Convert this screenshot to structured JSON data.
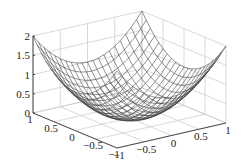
{
  "chart_data": {
    "type": "surface3d",
    "function": "z = x^2 + y^2",
    "title": "",
    "xlabel": "",
    "ylabel": "",
    "zlabel": "",
    "x_ticks": [
      -1,
      -0.5,
      0,
      0.5,
      1
    ],
    "y_ticks": [
      -1,
      -0.5,
      0,
      0.5,
      1
    ],
    "z_ticks": [
      0,
      0.5,
      1,
      1.5,
      2
    ],
    "x_tick_labels": [
      "−1",
      "−0.5",
      "0",
      "0.5",
      "1"
    ],
    "y_tick_labels": [
      "−1",
      "−0.5",
      "0",
      "0.5",
      "1"
    ],
    "z_tick_labels": [
      "0",
      "0.5",
      "1",
      "1.5",
      "2"
    ],
    "xlim": [
      -1,
      1
    ],
    "ylim": [
      -1,
      1
    ],
    "zlim": [
      0,
      2
    ],
    "grid": true,
    "mesh_resolution": 21,
    "colors": {
      "mesh": "#3a3a3a",
      "grid": "#c8c8c8",
      "axis": "#222222",
      "background": "#ffffff"
    }
  }
}
